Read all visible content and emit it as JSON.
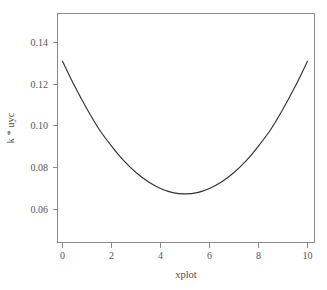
{
  "chart_data": {
    "type": "line",
    "title": "",
    "subtitle": "",
    "xlabel": "xplot",
    "ylabel": "k * uyc",
    "xlim": [
      0,
      10
    ],
    "ylim": [
      0.0495,
      0.1525
    ],
    "xticks": [
      0,
      2,
      4,
      6,
      8,
      10
    ],
    "xtick_labels": [
      "0",
      "2",
      "4",
      "6",
      "8",
      "10"
    ],
    "yticks": [
      0.06,
      0.08,
      0.1,
      0.12,
      0.14
    ],
    "ytick_labels": [
      "0.06",
      "0.08",
      "0.10",
      "0.12",
      "0.14"
    ],
    "grid": false,
    "legend": null,
    "legend_position": "none",
    "series": [
      {
        "name": "k * uyc",
        "color": "#333333",
        "x": [
          0,
          0.5,
          1,
          1.5,
          2,
          2.5,
          3,
          3.5,
          4,
          4.5,
          5,
          5.5,
          6,
          6.5,
          7,
          7.5,
          8,
          8.5,
          9,
          9.5,
          10
        ],
        "y": [
          0.131,
          0.119,
          0.1081,
          0.0983,
          0.0904,
          0.0834,
          0.0777,
          0.0733,
          0.0701,
          0.0681,
          0.0675,
          0.0681,
          0.0701,
          0.0733,
          0.0777,
          0.0834,
          0.0904,
          0.0983,
          0.1081,
          0.119,
          0.131
        ]
      }
    ],
    "annotations": [],
    "minimum": {
      "x": 5,
      "y": 0.0675
    },
    "endpoints": {
      "left": {
        "x": 0,
        "y": 0.131
      },
      "right": {
        "x": 10,
        "y": 0.131
      }
    }
  },
  "axes": {
    "frame_color": "#8a8a8a",
    "tick_color": "#8a8a8a",
    "label_color": "#555555",
    "title_color": "#4d4d4d",
    "background": "#ffffff"
  },
  "labels": {
    "x_axis_title": "xplot",
    "y_axis_title": "k * uyc",
    "x_tick_0": "0",
    "x_tick_1": "2",
    "x_tick_2": "4",
    "x_tick_3": "6",
    "x_tick_4": "8",
    "x_tick_5": "10",
    "y_tick_0": "0.06",
    "y_tick_1": "0.08",
    "y_tick_2": "0.10",
    "y_tick_3": "0.12",
    "y_tick_4": "0.14"
  }
}
